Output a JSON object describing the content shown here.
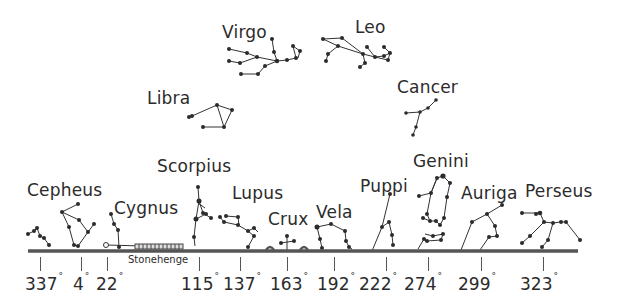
{
  "diagram": {
    "title": "",
    "horizon_label": "Stonehenge",
    "constellations": [
      {
        "name": "Virgo",
        "x": 222,
        "y": 22
      },
      {
        "name": "Leo",
        "x": 355,
        "y": 17
      },
      {
        "name": "Libra",
        "x": 147,
        "y": 88
      },
      {
        "name": "Cancer",
        "x": 397,
        "y": 77
      },
      {
        "name": "Scorpius",
        "x": 157,
        "y": 156
      },
      {
        "name": "Cepheus",
        "x": 27,
        "y": 180
      },
      {
        "name": "Cygnus",
        "x": 114,
        "y": 198
      },
      {
        "name": "Lupus",
        "x": 232,
        "y": 183
      },
      {
        "name": "Crux",
        "x": 268,
        "y": 209
      },
      {
        "name": "Vela",
        "x": 316,
        "y": 202
      },
      {
        "name": "Puppi",
        "x": 360,
        "y": 176
      },
      {
        "name": "Genini",
        "x": 413,
        "y": 151
      },
      {
        "name": "Auriga",
        "x": 461,
        "y": 183
      },
      {
        "name": "Perseus",
        "x": 525,
        "y": 181
      }
    ],
    "azimuths": [
      {
        "value": "337",
        "unit": "°",
        "tick_x": 40,
        "label_x": 25
      },
      {
        "value": "4",
        "unit": "°",
        "tick_x": 81,
        "label_x": 72
      },
      {
        "value": "22",
        "unit": "°",
        "tick_x": 107,
        "label_x": 95
      },
      {
        "value": "115",
        "unit": "°",
        "tick_x": 199,
        "label_x": 181
      },
      {
        "value": "137",
        "unit": "°",
        "tick_x": 240,
        "label_x": 222
      },
      {
        "value": "163",
        "unit": "°",
        "tick_x": 287,
        "label_x": 269
      },
      {
        "value": "192",
        "unit": "°",
        "tick_x": 334,
        "label_x": 316
      },
      {
        "value": "222",
        "unit": "°",
        "tick_x": 386,
        "label_x": 360
      },
      {
        "value": "274",
        "unit": "°",
        "tick_x": 428,
        "label_x": 404
      },
      {
        "value": "299",
        "unit": "°",
        "tick_x": 481,
        "label_x": 458
      },
      {
        "value": "323",
        "unit": "°",
        "tick_x": 543,
        "label_x": 520
      }
    ],
    "colors": {
      "ink": "#2b2b2b",
      "horizon": "#555555",
      "background": "#ffffff"
    }
  }
}
